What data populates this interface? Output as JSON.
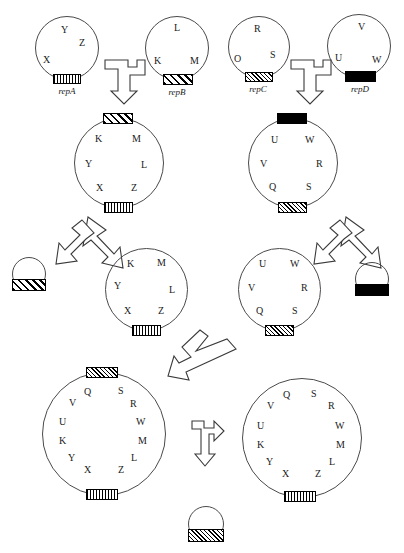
{
  "figure": {
    "stroke_color": "#3a3a3a",
    "text_color": "#1a1a1a",
    "background": "#ffffff"
  },
  "rep_blocks": {
    "repA": {
      "label": "repA",
      "pattern": "vertical-stripes"
    },
    "repB": {
      "label": "repB",
      "pattern": "diagonal-hatch"
    },
    "repC": {
      "label": "repC",
      "pattern": "fine-diagonal-hatch"
    },
    "repD": {
      "label": "repD",
      "pattern": "solid-black"
    }
  },
  "row1": {
    "plasmids": [
      {
        "name": "plasmid-repA",
        "rep": "repA",
        "rep_label": "repA",
        "genes": [
          "Y",
          "Z",
          "X"
        ],
        "top_block": null,
        "bottom_block": "vertical-stripes"
      },
      {
        "name": "plasmid-repB",
        "rep": "repB",
        "rep_label": "repB",
        "genes": [
          "L",
          "K",
          "M"
        ],
        "top_block": null,
        "bottom_block": "diagonal-hatch"
      },
      {
        "name": "plasmid-repC",
        "rep": "repC",
        "rep_label": "repC",
        "genes": [
          "R",
          "O",
          "S"
        ],
        "top_block": null,
        "bottom_block": "fine-diagonal-hatch"
      },
      {
        "name": "plasmid-repD",
        "rep": "repD",
        "rep_label": "repD",
        "genes": [
          "V",
          "U",
          "W"
        ],
        "top_block": null,
        "bottom_block": "solid-black"
      }
    ],
    "arrows": [
      {
        "name": "fusion-arrow-left",
        "type": "merge-down"
      },
      {
        "name": "fusion-arrow-right",
        "type": "merge-down"
      }
    ]
  },
  "row2": {
    "plasmids": [
      {
        "name": "cointegrate-AB",
        "genes": [
          "K",
          "M",
          "Y",
          "L",
          "X",
          "Z"
        ],
        "top_block": "diagonal-hatch",
        "bottom_block": "vertical-stripes"
      },
      {
        "name": "cointegrate-CD",
        "genes": [
          "U",
          "W",
          "V",
          "R",
          "Q",
          "S"
        ],
        "top_block": "solid-black",
        "bottom_block": "fine-diagonal-hatch"
      }
    ],
    "arrows": [
      {
        "name": "resolution-arrow-left",
        "type": "split-down"
      },
      {
        "name": "resolution-arrow-right",
        "type": "split-down"
      }
    ]
  },
  "row3": {
    "plasmids": [
      {
        "name": "resolved-plasmid-A",
        "genes": [
          "K",
          "M",
          "Y",
          "L",
          "X",
          "Z"
        ],
        "top_block": null,
        "bottom_block": "vertical-stripes"
      },
      {
        "name": "resolved-plasmid-C",
        "genes": [
          "U",
          "W",
          "V",
          "R",
          "Q",
          "S"
        ],
        "top_block": null,
        "bottom_block": "fine-diagonal-hatch"
      }
    ],
    "excised": [
      {
        "name": "excised-repB-circle",
        "block": "diagonal-hatch"
      },
      {
        "name": "excised-repD-circle",
        "block": "solid-black"
      }
    ],
    "arrows": [
      {
        "name": "second-fusion-arrow",
        "type": "merge-down-left"
      }
    ]
  },
  "row4": {
    "plasmids": [
      {
        "name": "large-cointegrate",
        "genes": [
          "Q",
          "S",
          "V",
          "R",
          "U",
          "W",
          "K",
          "M",
          "Y",
          "L",
          "X",
          "Z"
        ],
        "top_block": "fine-diagonal-hatch",
        "bottom_block": "vertical-stripes"
      },
      {
        "name": "final-resolved-plasmid",
        "genes": [
          "Q",
          "S",
          "V",
          "R",
          "U",
          "W",
          "K",
          "M",
          "Y",
          "L",
          "X",
          "Z"
        ],
        "top_block": null,
        "bottom_block": "vertical-stripes"
      }
    ],
    "arrows": [
      {
        "name": "final-resolution-arrow",
        "type": "split-right-down"
      }
    ],
    "excised": [
      {
        "name": "excised-repC-circle",
        "block": "fine-diagonal-hatch"
      }
    ]
  },
  "labels": {
    "g_X": "X",
    "g_Y": "Y",
    "g_Z": "Z",
    "g_K": "K",
    "g_L": "L",
    "g_M": "M",
    "g_O": "O",
    "g_R": "R",
    "g_S": "S",
    "g_U": "U",
    "g_V": "V",
    "g_W": "W",
    "g_Q": "Q"
  }
}
